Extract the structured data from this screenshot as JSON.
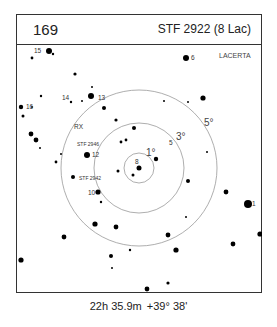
{
  "header": {
    "chart_number": "169",
    "title": "STF 2922 (8 Lac)"
  },
  "constellation": "LACERTA",
  "footer": {
    "ra": "22h 35.9m",
    "dec": "+39° 38'"
  },
  "circles": [
    {
      "label": "1°",
      "r": 15
    },
    {
      "label": "3°",
      "r": 45
    },
    {
      "label": "5°",
      "r": 78
    }
  ],
  "labels": {
    "s15": "15",
    "s6": "6",
    "s14": "14",
    "s13": "13",
    "s16": "16",
    "rx": "RX",
    "stf2946": "STF 2946",
    "s12": "12",
    "stf2942": "STF 2942",
    "s10": "10",
    "s8": "8",
    "s5": "5",
    "s1": "1"
  }
}
